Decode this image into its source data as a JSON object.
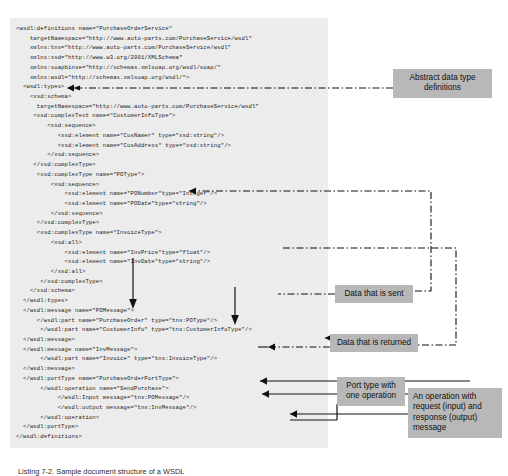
{
  "document": {
    "title": "WSDL document structure annotated diagram",
    "caption": "Listing 7-2. Sample document structure of a WSDL"
  },
  "code": {
    "language": "xml",
    "background_color": "#ececec",
    "lines": [
      "<wsdl:definitions name=\"PurchaseOrderService\"",
      "    targetNamespace=\"http://www.auto-parts.com/PurchaseService/wsdl\"",
      "    xmlns:tns=\"http://www.auto-parts.com/PurchaseService/wsdl\"",
      "    xmlns:xsd=\"http://www.w3.org/2001/XMLSchema\"",
      "    xmlns:soapbinse=\"http://schemas.xmlsoap.org/wsdl/soap/\"",
      "    xmlns:wsdl=\"http://schemas.xmlsoap.org/wsdl/\">",
      "  <wsdl:types>",
      "    <xsd:schema>",
      "      targetNamespace=\"http://www.auto-parts.com/PurchaseService/wsdl\"",
      "     <xsd:complexText name=\"CustomerInfoType\">",
      "         <xsd:sequence>",
      "            <xsd:element name=\"CusNamer\" type=\"xsd:string\"/>",
      "            <xsd:element name=\"CusAddress\" type=\"xsd:string\"/>",
      "         </xsd:sequence>",
      "     </xsd:complexType>",
      "      <xsd:complexType name=\"POType\">",
      "          <xsd:sequence>",
      "              <xsd:element name=\"PONumber\"type=\"Integer\"/>",
      "              <xsd:element name=\"PODate\"type=\"string\"/>",
      "          </xsd:sequence>",
      "      </xsd:complexType>",
      "      <xsd:complexType name=\"InvoiceType\">",
      "          <xsd:all>",
      "              <xsd:element name=\"InvPrice\"type=\"float\"/>",
      "              <xsd:element name=\"InvDate\"type=\"string\"/>",
      "          </xsd:all>",
      "       </xsd:complexType>",
      "    </xsd:schema>",
      "  </wsdl:types>",
      "  </wsdl:message name=\"POMessage\">",
      "      </wsdl:part name=\"PurchaseOrder\" type=\"tns:POType\"/>",
      "       </wsdl:part name=\"CustomerInfo\" type=\"tns:CustomerInfoType\"/>",
      "  </wsdl:message>",
      "  </wsdl:message name=\"InvMessage\">",
      "       </wsdl:part name=\"Invoice\" type=\"tns:InvoiceType\"/>",
      "  </wsdl:message>",
      "  </wsdl:portType name=\"PurchaseOrderPortType\">",
      "       </wsdl:operation name=\"SendPurchase\">",
      "            </wsdl:Input message=\"tns:POMessage\"/>",
      "            </wsdl:output message=\"tns:InvMessage\"/>",
      "       </wsdl:operation>",
      "  </wsdl:portType>",
      "</wsdl:definitions>"
    ]
  },
  "callouts": {
    "abstract_types": "Abstract data type definitions",
    "data_sent": "Data that is sent",
    "data_returned": "Data that is returned",
    "port_type": "Port type with one operation",
    "operation": "An operation with request (input) and response (output) message"
  },
  "colors": {
    "code_background": "#ececec",
    "callout_background": "#b8b8b8",
    "line": "#111111",
    "text": "#1a1a1a"
  }
}
